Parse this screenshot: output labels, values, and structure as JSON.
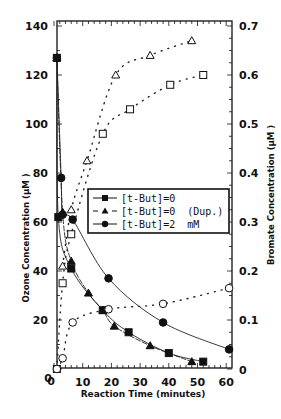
{
  "chart_data": {
    "type": "line",
    "title": "",
    "xlabel": "Reaction Time (minutes)",
    "ylabel": "Ozone Concentration (µM )",
    "y2label": "Bromate Concentration (µM )",
    "xlim": [
      0,
      60
    ],
    "ylim": [
      0,
      140
    ],
    "y2lim": [
      0,
      0.7
    ],
    "x_ticks": [
      "0",
      "10",
      "20",
      "30",
      "40",
      "50",
      "60"
    ],
    "y_ticks": [
      "0",
      "20",
      "40",
      "60",
      "80",
      "100",
      "120",
      "140"
    ],
    "y2_ticks": [
      "0",
      "0.1",
      "0.2",
      "0.3",
      "0.4",
      "0.5",
      "0.6",
      "0.7"
    ],
    "grid": false,
    "legend_position": "center",
    "legend": [
      {
        "label": "[t-But]=0",
        "marker": "filled-square",
        "line": "solid"
      },
      {
        "label": "[t-But]=0  (Dup.)",
        "marker": "filled-triangle",
        "line": "dashed"
      },
      {
        "label": "[t-But]=2  mM",
        "marker": "filled-circle",
        "line": "solid"
      }
    ],
    "series": [
      {
        "name": "Ozone [t-But]=0",
        "axis": "left",
        "marker": "filled-square",
        "line": "solid",
        "x": [
          1,
          1.5,
          6,
          17,
          26,
          40,
          52
        ],
        "y": [
          127,
          62,
          41,
          24,
          15,
          6.5,
          3
        ]
      },
      {
        "name": "Ozone [t-But]=0 (Dup.)",
        "axis": "left",
        "marker": "filled-triangle",
        "line": "dashed",
        "x": [
          1,
          3,
          6,
          12,
          17,
          21,
          33.5,
          48
        ],
        "y": [
          127,
          64,
          44,
          31,
          24,
          17.5,
          9.5,
          3
        ]
      },
      {
        "name": "Ozone [t-But]=2 mM",
        "axis": "left",
        "marker": "filled-circle",
        "line": "solid",
        "x": [
          1,
          2.5,
          3,
          6.5,
          19,
          38,
          61
        ],
        "y": [
          127,
          78,
          63,
          61,
          37,
          19,
          8
        ]
      },
      {
        "name": "Bromate [t-But]=0",
        "axis": "right",
        "marker": "open-square",
        "line": "dotted",
        "x": [
          1,
          3,
          6,
          17,
          26.5,
          40.5,
          52
        ],
        "y": [
          0,
          0.175,
          0.275,
          0.48,
          0.53,
          0.58,
          0.6
        ]
      },
      {
        "name": "Bromate [t-But]=0 (Dup.)",
        "axis": "right",
        "marker": "open-triangle",
        "line": "dotted",
        "x": [
          3,
          6,
          11.5,
          21.5,
          33.5,
          48
        ],
        "y": [
          0.21,
          0.325,
          0.425,
          0.6,
          0.64,
          0.67
        ]
      },
      {
        "name": "Bromate [t-But]=2 mM",
        "axis": "right",
        "marker": "open-circle",
        "line": "dotted",
        "x": [
          1,
          3,
          6.5,
          19,
          38,
          61
        ],
        "y": [
          0,
          0.022,
          0.095,
          0.122,
          0.133,
          0.165
        ]
      }
    ]
  }
}
